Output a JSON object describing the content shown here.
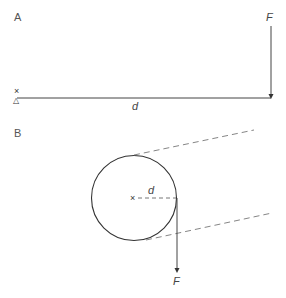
{
  "panels": [
    {
      "id": "A",
      "label": "A",
      "pivot_mark": "×",
      "support_mark": "△",
      "distance_label": "d",
      "force_label": "F"
    },
    {
      "id": "B",
      "label": "B",
      "center_mark": "×",
      "distance_label": "d",
      "force_label": "F"
    }
  ],
  "colors": {
    "stroke": "#333333",
    "dashed": "#777777",
    "background": "#ffffff"
  }
}
